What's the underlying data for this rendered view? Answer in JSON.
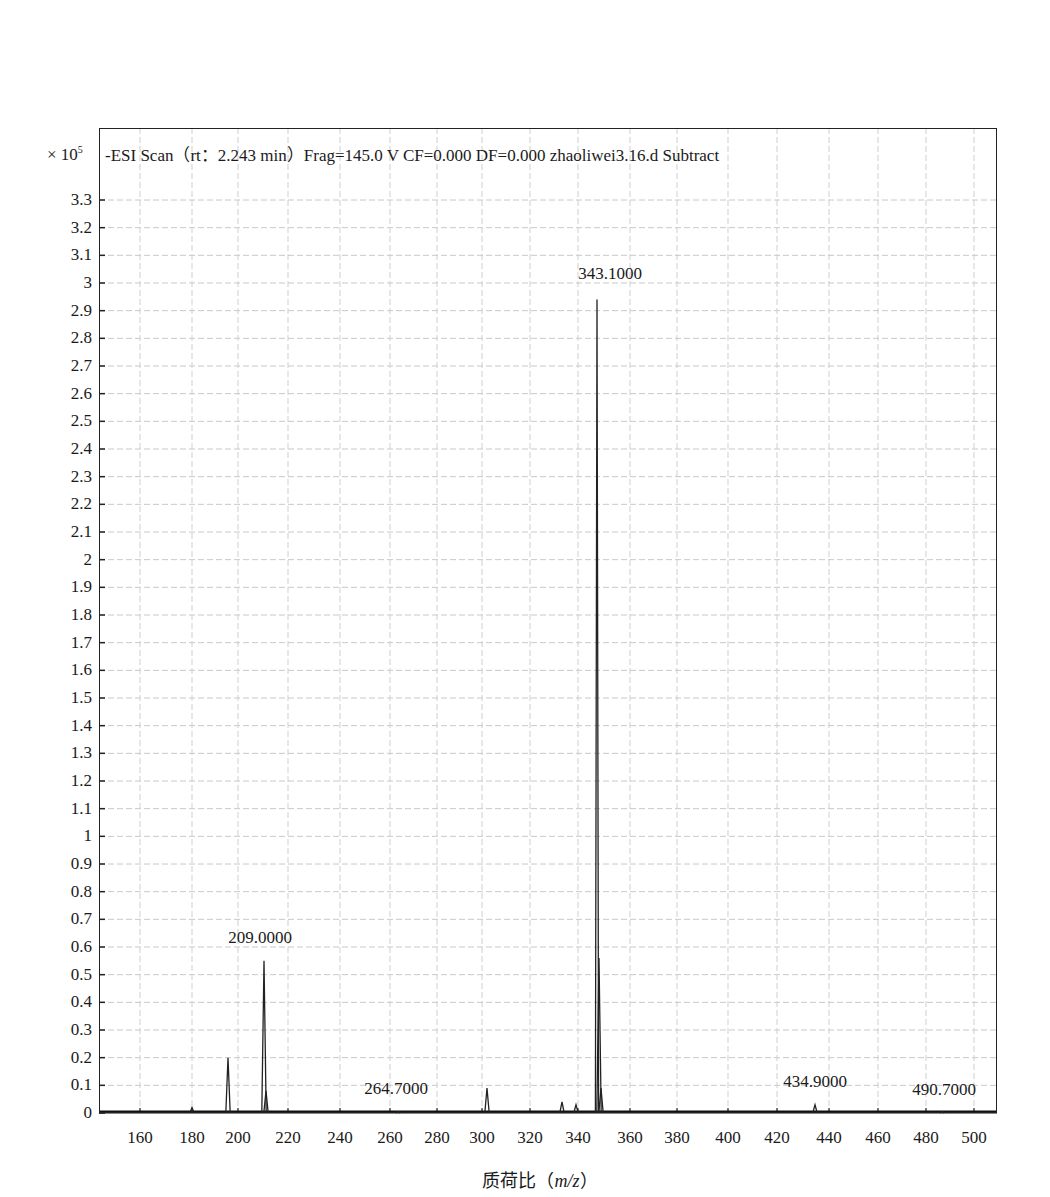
{
  "chart_data": {
    "type": "line",
    "xlabel": "质荷比（m/z）",
    "ylabel": "",
    "y_multiplier": "× 10^5",
    "xlim": [
      145,
      505
    ],
    "ylim": [
      0,
      3.35
    ],
    "grid": true,
    "legend": null,
    "x_ticks": [
      "160",
      "180",
      "200",
      "220",
      "240",
      "260",
      "280",
      "300",
      "320",
      "340",
      "360",
      "380",
      "400",
      "420",
      "440",
      "460",
      "480",
      "500"
    ],
    "y_ticks": [
      "0",
      "0.1",
      "0.2",
      "0.3",
      "0.4",
      "0.5",
      "0.6",
      "0.7",
      "0.8",
      "0.9",
      "1",
      "1.1",
      "1.2",
      "1.3",
      "1.4",
      "1.5",
      "1.6",
      "1.7",
      "1.8",
      "1.9",
      "2",
      "2.1",
      "2.2",
      "2.3",
      "2.4",
      "2.5",
      "2.6",
      "2.7",
      "2.8",
      "2.9",
      "3",
      "3.1",
      "3.2",
      "3.3"
    ],
    "peaks": [
      {
        "mz": 180.0,
        "intensity": 0.02
      },
      {
        "mz": 196.0,
        "intensity": 0.2
      },
      {
        "mz": 209.0,
        "intensity": 0.55,
        "label": "209.0000"
      },
      {
        "mz": 210.0,
        "intensity": 0.08
      },
      {
        "mz": 264.7,
        "intensity": 0.005,
        "label": "264.7000"
      },
      {
        "mz": 304.0,
        "intensity": 0.09
      },
      {
        "mz": 335.0,
        "intensity": 0.04
      },
      {
        "mz": 340.0,
        "intensity": 0.03
      },
      {
        "mz": 343.1,
        "intensity": 2.94,
        "label": "343.1000"
      },
      {
        "mz": 344.0,
        "intensity": 0.56
      },
      {
        "mz": 345.0,
        "intensity": 0.09
      },
      {
        "mz": 434.9,
        "intensity": 0.03,
        "label": "434.9000"
      },
      {
        "mz": 490.7,
        "intensity": 0.005,
        "label": "490.7000"
      }
    ]
  },
  "labels": {
    "exponent_base": "× 10",
    "exponent_power": "5",
    "title": "-ESI Scan（rt：2.243 min）Frag=145.0 V CF=0.000 DF=0.000 zhaoliwei3.16.d Subtract",
    "xlabel_prefix": "质荷比（",
    "xlabel_var": "m/z",
    "xlabel_suffix": "）"
  },
  "layout": {
    "x_tick_px": [
      140,
      192,
      238,
      288,
      340,
      390,
      437,
      482,
      530,
      578,
      630,
      677,
      728,
      777,
      829,
      878,
      926,
      974
    ],
    "peak_px": {
      "180.0": 192,
      "196.0": 228,
      "209.0": 264,
      "210.0": 266,
      "264.7": 398,
      "304.0": 487,
      "335.0": 562,
      "340.0": 576,
      "343.1": 597,
      "344.0": 599,
      "345.0": 601,
      "434.9": 815,
      "490.7": 942
    },
    "label_px": {
      "209.0000": [
        260,
        937
      ],
      "264.7000": [
        396,
        1088
      ],
      "343.1000": [
        610,
        273
      ],
      "434.9000": [
        815,
        1081
      ],
      "490.7000": [
        944,
        1089
      ]
    }
  }
}
